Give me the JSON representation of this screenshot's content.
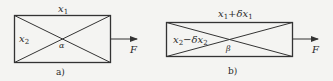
{
  "panel_a": {
    "top_label": "x",
    "top_sub": "1",
    "left_label": "x",
    "left_sub": "2",
    "angle_label": "α",
    "force_label": "F",
    "caption": "a)"
  },
  "panel_b": {
    "top_label": "x",
    "top_sub": "1",
    "top_suffix": "+δx",
    "top_suffix_sub": "1",
    "left_label": "x",
    "left_sub": "2",
    "left_suffix": "−δx",
    "left_suffix_sub": "2",
    "angle_label": "β",
    "force_label": "F",
    "caption": "b)"
  },
  "colors": {
    "line": "#333333",
    "background": "#f4f4f2"
  }
}
